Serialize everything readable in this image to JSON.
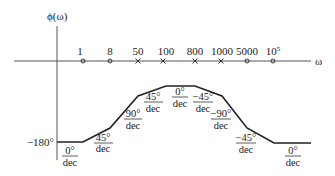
{
  "figure": {
    "y_axis_label": "ϕ(ω)",
    "x_axis_label": "ω",
    "y_tick_label": "−180°",
    "colors": {
      "line": "#222222",
      "axis": "#555555",
      "background": "#ffffff"
    }
  },
  "markers": [
    {
      "label": "1",
      "type": "zero",
      "symbol": "o"
    },
    {
      "label": "8",
      "type": "zero",
      "symbol": "o"
    },
    {
      "label": "50",
      "type": "pole",
      "symbol": "x"
    },
    {
      "label": "100",
      "type": "pole",
      "symbol": "x"
    },
    {
      "label": "800",
      "type": "pole",
      "symbol": "x"
    },
    {
      "label": "1000",
      "type": "pole",
      "symbol": "x"
    },
    {
      "label": "5000",
      "type": "zero",
      "symbol": "o"
    },
    {
      "label": "10",
      "sup": "5",
      "type": "zero",
      "symbol": "o"
    }
  ],
  "slopes": [
    {
      "num": "0°",
      "den": "dec"
    },
    {
      "num": "45°",
      "den": "dec"
    },
    {
      "num": "90°",
      "den": "dec"
    },
    {
      "num": "45°",
      "den": "dec"
    },
    {
      "num": "0°",
      "den": "dec"
    },
    {
      "num": "−45°",
      "den": "dec"
    },
    {
      "num": "−90°",
      "den": "dec"
    },
    {
      "num": "−45°",
      "den": "dec"
    },
    {
      "num": "0°",
      "den": "dec"
    }
  ]
}
